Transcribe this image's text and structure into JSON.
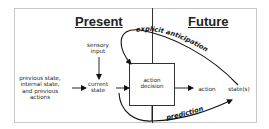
{
  "diagram": {
    "sections": {
      "present": "Present",
      "future": "Future"
    },
    "nodes": {
      "sensory_input": [
        "sensory",
        "input"
      ],
      "previous_state": [
        "previous state,",
        "internal state,",
        "and previous",
        "actions"
      ],
      "current_state": [
        "current",
        "state"
      ],
      "action_decision": [
        "action",
        "decision"
      ],
      "action": "action",
      "states": "state(s)"
    },
    "edges": {
      "explicit_anticipation": "explicit anticipation",
      "prediction": "prediction"
    },
    "colors": {
      "line": "#111111",
      "frame": "#c8c8c8",
      "background": "#ffffff"
    }
  }
}
